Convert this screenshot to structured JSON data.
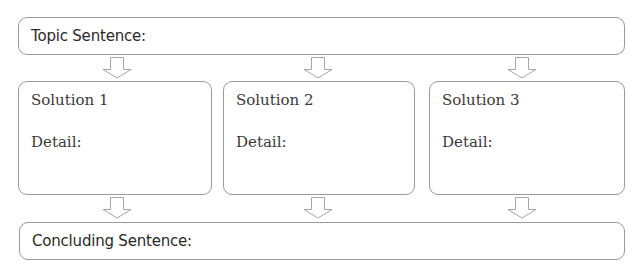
{
  "topic": {
    "label": "Topic Sentence:"
  },
  "solutions": [
    {
      "title": "Solution 1",
      "detail_label": "Detail:"
    },
    {
      "title": "Solution 2",
      "detail_label": "Detail:"
    },
    {
      "title": "Solution 3",
      "detail_label": "Detail:"
    }
  ],
  "conclusion": {
    "label": "Concluding Sentence:"
  },
  "arrows": {
    "icon": "down-arrow-icon",
    "stroke_color": "#a6a6a6"
  },
  "colors": {
    "border": "#9a9a9a",
    "text": "#2a2a2a",
    "background": "#ffffff"
  }
}
